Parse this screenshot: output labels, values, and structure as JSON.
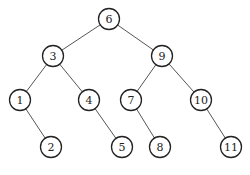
{
  "diagram": {
    "type": "binary-search-tree",
    "root": "6",
    "nodes": [
      {
        "id": "n6",
        "label": "6",
        "x": 109,
        "y": 19
      },
      {
        "id": "n3",
        "label": "3",
        "x": 53,
        "y": 56
      },
      {
        "id": "n9",
        "label": "9",
        "x": 162,
        "y": 56
      },
      {
        "id": "n1",
        "label": "1",
        "x": 20,
        "y": 100
      },
      {
        "id": "n4",
        "label": "4",
        "x": 89,
        "y": 100
      },
      {
        "id": "n7",
        "label": "7",
        "x": 131,
        "y": 100
      },
      {
        "id": "n10",
        "label": "10",
        "x": 201,
        "y": 100
      },
      {
        "id": "n2",
        "label": "2",
        "x": 51,
        "y": 147
      },
      {
        "id": "n5",
        "label": "5",
        "x": 122,
        "y": 147
      },
      {
        "id": "n8",
        "label": "8",
        "x": 160,
        "y": 147
      },
      {
        "id": "n11",
        "label": "11",
        "x": 231,
        "y": 147
      }
    ],
    "edges": [
      {
        "from": "n6",
        "to": "n3"
      },
      {
        "from": "n6",
        "to": "n9"
      },
      {
        "from": "n3",
        "to": "n1"
      },
      {
        "from": "n3",
        "to": "n4"
      },
      {
        "from": "n9",
        "to": "n7"
      },
      {
        "from": "n9",
        "to": "n10"
      },
      {
        "from": "n1",
        "to": "n2"
      },
      {
        "from": "n4",
        "to": "n5"
      },
      {
        "from": "n7",
        "to": "n8"
      },
      {
        "from": "n10",
        "to": "n11"
      }
    ],
    "node_radius": 10.5
  }
}
